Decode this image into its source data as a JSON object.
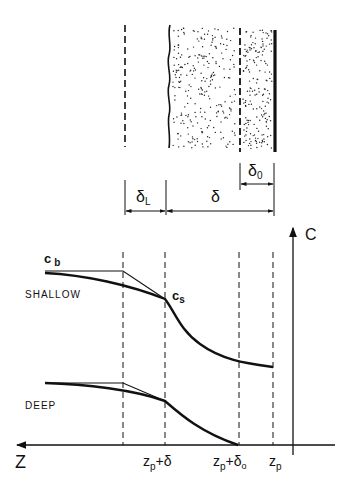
{
  "diagram": {
    "type": "concentration-profile-schematic",
    "top_panel": {
      "regions": [
        "liquid film",
        "deposit layer",
        "inner layer",
        "wall"
      ],
      "dimensions": [
        {
          "symbol": "δ",
          "subscript": "L"
        },
        {
          "symbol": "δ",
          "subscript": ""
        },
        {
          "symbol": "δ",
          "subscript": "0"
        }
      ]
    },
    "bottom_panel": {
      "y_axis_label": "C",
      "x_axis_label": "Z",
      "labels": {
        "c_b": {
          "main": "c",
          "sub": "b"
        },
        "c_s": {
          "main": "c",
          "sub": "s"
        },
        "shallow": "SHALLOW",
        "deep": "DEEP"
      },
      "x_ticks": [
        {
          "main": "z",
          "sub": "p",
          "suffix": "+δ",
          "suffix_sub": ""
        },
        {
          "main": "z",
          "sub": "p",
          "suffix": "+δ",
          "suffix_sub": "o"
        },
        {
          "main": "z",
          "sub": "p",
          "suffix": "",
          "suffix_sub": ""
        }
      ]
    }
  },
  "colors": {
    "ink": "#111111",
    "background": "#ffffff"
  }
}
